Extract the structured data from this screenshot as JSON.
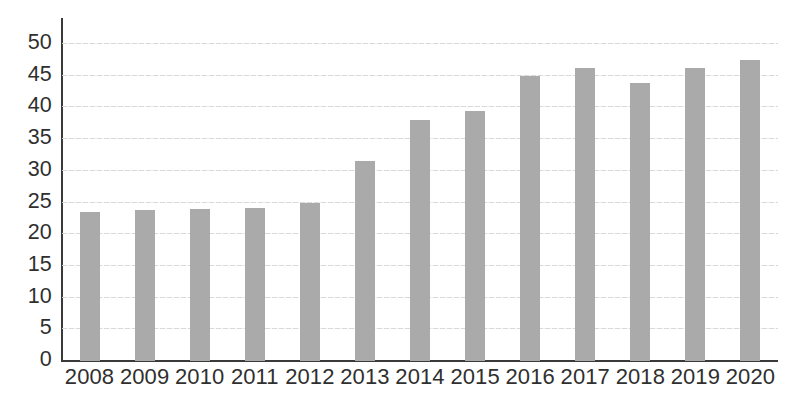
{
  "chart_data": {
    "type": "bar",
    "title": "",
    "subtitle": "",
    "xlabel": "",
    "ylabel": "",
    "categories": [
      "2008",
      "2009",
      "2010",
      "2011",
      "2012",
      "2013",
      "2014",
      "2015",
      "2016",
      "2017",
      "2018",
      "2019",
      "2020"
    ],
    "values": [
      23.5,
      23.8,
      23.9,
      24.1,
      25.0,
      31.5,
      38.0,
      39.5,
      45.0,
      46.2,
      43.8,
      46.2,
      47.5
    ],
    "series": [
      {
        "name": "",
        "values": [
          23.5,
          23.8,
          23.9,
          24.1,
          25.0,
          31.5,
          38.0,
          39.5,
          45.0,
          46.2,
          43.8,
          46.2,
          47.5
        ]
      }
    ],
    "ylim": [
      0,
      50
    ],
    "ytick_step": 5,
    "ytick_labels": [
      "50",
      "45",
      "40",
      "35",
      "30",
      "25",
      "20",
      "15",
      "10",
      "5",
      "0"
    ],
    "ytick_values": [
      50,
      45,
      40,
      35,
      30,
      25,
      20,
      15,
      10,
      5,
      0
    ],
    "grid": true,
    "grid_axis": "y",
    "legend": false,
    "legend_position": "none",
    "annotations": [],
    "colors": {
      "bar": "#aaaaaa",
      "gridline": "#d7d7d7",
      "axis": "#3a3a3a",
      "text": "#2f2f2f",
      "background": "#ffffff"
    }
  }
}
